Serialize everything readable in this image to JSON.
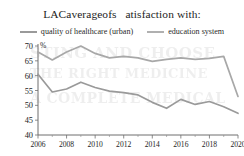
{
  "chart_data": {
    "type": "line",
    "title": "LACaverageofs   atisfaction with:",
    "subtitle": "",
    "xlabel": "",
    "ylabel": "%",
    "ylim": [
      40,
      70
    ],
    "yticks": [
      40,
      45,
      50,
      55,
      60,
      65,
      70
    ],
    "ytick_labels": [
      "40",
      "45",
      "50",
      "55",
      "60",
      "65",
      "70"
    ],
    "xlim": [
      2006,
      2020
    ],
    "x": [
      2006,
      2007,
      2008,
      2009,
      2010,
      2011,
      2012,
      2013,
      2014,
      2015,
      2016,
      2017,
      2018,
      2019,
      2020
    ],
    "xticks": [
      2006,
      2008,
      2010,
      2012,
      2014,
      2016,
      2018,
      2020
    ],
    "xtick_labels": [
      "2006",
      "2008",
      "2010",
      "2012",
      "2014",
      "2016",
      "2018",
      "2020"
    ],
    "grid": false,
    "legend_position": "top",
    "series": [
      {
        "name": "quality of healthcare (urban)",
        "color": "#9a9a9a",
        "values": [
          60.5,
          54.5,
          55.5,
          57.8,
          56.0,
          54.8,
          54.3,
          53.5,
          51.0,
          49.0,
          52.0,
          50.3,
          51.3,
          49.5,
          47.3
        ]
      },
      {
        "name": "education system",
        "color": "#a8a8a8",
        "values": [
          68.0,
          65.3,
          68.0,
          70.0,
          67.5,
          66.0,
          66.5,
          66.0,
          64.8,
          65.5,
          66.0,
          65.5,
          65.8,
          66.5,
          53.0
        ]
      }
    ]
  },
  "legend": {
    "items": [
      {
        "label": "quality of healthcare (urban)",
        "color": "#9a9a9a"
      },
      {
        "label": "education system",
        "color": "#a8a8a8"
      }
    ]
  },
  "axes": {
    "y_unit_label": "%"
  },
  "ghost_text": {
    "lines": [
      "STING AND CHOOSE",
      "THE RIGHT MEDICINE",
      "A COMPLETE MEDICAL"
    ]
  }
}
